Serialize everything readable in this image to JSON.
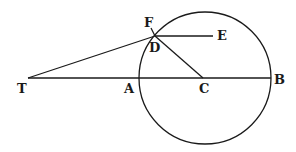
{
  "diagram": {
    "type": "geometric-figure",
    "colors": {
      "ink": "#1a1a1a",
      "background": "#ffffff"
    },
    "points": {
      "T": {
        "label": "T",
        "x": 28,
        "y": 78
      },
      "A": {
        "label": "A",
        "x": 140,
        "y": 78
      },
      "C": {
        "label": "C",
        "x": 203,
        "y": 78
      },
      "B": {
        "label": "B",
        "x": 270,
        "y": 78
      },
      "D": {
        "label": "D",
        "x": 155,
        "y": 36
      },
      "E": {
        "label": "E",
        "x": 213,
        "y": 36
      },
      "F": {
        "label": "F",
        "x": 150,
        "y": 28
      }
    },
    "circle": {
      "cx": 205,
      "cy": 78,
      "r": 66
    },
    "segments": [
      {
        "from": "T",
        "to": "B"
      },
      {
        "from": "T",
        "to": "D"
      },
      {
        "from": "D",
        "to": "C"
      },
      {
        "from": "D",
        "to": "E"
      },
      {
        "from": "F",
        "to": "D"
      }
    ]
  }
}
